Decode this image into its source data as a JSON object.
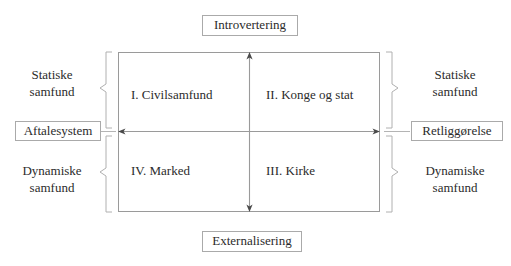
{
  "diagram": {
    "title_top": "Introvertering",
    "title_bottom": "Externalisering",
    "axis_left_label": "Aftalesystem",
    "axis_right_label": "Retliggørelse",
    "quadrants": [
      {
        "id": "quadrant-1",
        "label": "I. Civilsamfund"
      },
      {
        "id": "quadrant-2",
        "label": "II. Konge og stat"
      },
      {
        "id": "quadrant-3",
        "label": "III. Kirke"
      },
      {
        "id": "quadrant-4",
        "label": "IV. Marked"
      }
    ],
    "side_labels": {
      "left_top_line1": "Statiske",
      "left_top_line2": "samfund",
      "left_bottom_line1": "Dynamiske",
      "left_bottom_line2": "samfund",
      "right_top_line1": "Statiske",
      "right_top_line2": "samfund",
      "right_bottom_line1": "Dynamiske",
      "right_bottom_line2": "samfund"
    },
    "colors": {
      "line": "#9a9a9a",
      "text": "#2b2b2b",
      "box_border": "#aaaaaa",
      "background": "#ffffff"
    }
  }
}
